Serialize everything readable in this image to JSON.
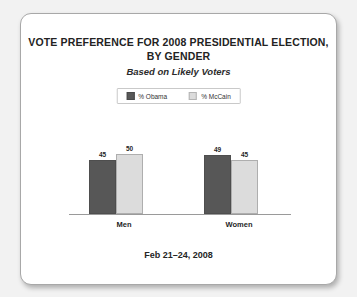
{
  "card": {
    "title_line1": "VOTE PREFERENCE FOR 2008 PRESIDENTIAL ELECTION,",
    "title_line2": "BY GENDER",
    "subtitle": "Based on Likely Voters",
    "footer_date": "Feb 21–24, 2008"
  },
  "colors": {
    "obama": "#575757",
    "mccain": "#dcdcdc",
    "axis": "#9a9a9a",
    "card_background": "#ffffff",
    "page_background": "#f2f2f2"
  },
  "chart_data": {
    "type": "bar",
    "title": "VOTE PREFERENCE FOR 2008 PRESIDENTIAL ELECTION, BY GENDER",
    "subtitle": "Based on Likely Voters",
    "xlabel": "",
    "ylabel": "",
    "ylim": [
      0,
      68
    ],
    "grid": false,
    "legend_position": "top-center",
    "annotation": "Feb 21–24, 2008",
    "categories": [
      "Men",
      "Women"
    ],
    "series": [
      {
        "name": "% Obama",
        "values": [
          45,
          49
        ]
      },
      {
        "name": "% McCain",
        "values": [
          50,
          45
        ]
      }
    ]
  }
}
